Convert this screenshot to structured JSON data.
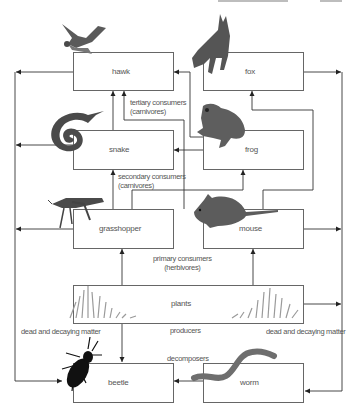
{
  "diagram": {
    "type": "food web",
    "organisms": {
      "hawk": "hawk",
      "fox": "fox",
      "snake": "snake",
      "frog": "frog",
      "grasshopper": "grasshopper",
      "mouse": "mouse",
      "plants": "plants",
      "beetle": "beetle",
      "worm": "worm"
    },
    "captions": {
      "tertiary_line1": "tertiary consumers",
      "tertiary_line2": "(carnivores)",
      "secondary_line1": "secondary consumers",
      "secondary_line2": "(carnivores)",
      "primary_line1": "primary consumers",
      "primary_line2": "(herbivores)",
      "producers": "producers",
      "decomposers": "decomposers",
      "dead_left": "dead and decaying matter",
      "dead_right": "dead and decaying matter"
    },
    "edges": [
      {
        "from": "snake",
        "to": "hawk"
      },
      {
        "from": "grasshopper",
        "to": "snake"
      },
      {
        "from": "frog",
        "to": "hawk"
      },
      {
        "from": "mouse",
        "to": "hawk"
      },
      {
        "from": "frog",
        "to": "snake"
      },
      {
        "from": "mouse",
        "to": "fox"
      },
      {
        "from": "grasshopper",
        "to": "frog"
      },
      {
        "from": "plants",
        "to": "grasshopper"
      },
      {
        "from": "plants",
        "to": "mouse"
      },
      {
        "from": "plants",
        "to": "beetle"
      },
      {
        "from": "worm",
        "to": "beetle"
      },
      {
        "from": "hawk",
        "to": "dead and decaying matter"
      },
      {
        "from": "snake",
        "to": "dead and decaying matter"
      },
      {
        "from": "grasshopper",
        "to": "dead and decaying matter"
      },
      {
        "from": "fox",
        "to": "dead and decaying matter"
      },
      {
        "from": "mouse",
        "to": "dead and decaying matter"
      },
      {
        "from": "plants",
        "to": "dead and decaying matter"
      }
    ],
    "colors": {
      "line": "#333333",
      "box_border": "#666666",
      "animal_gray": "#555555",
      "beetle": "#111111",
      "grass": "#a0a0a0"
    }
  }
}
